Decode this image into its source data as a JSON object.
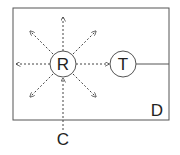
{
  "diagram": {
    "container": {
      "label": "D"
    },
    "nodes": [
      {
        "id": "R",
        "label": "R"
      },
      {
        "id": "T",
        "label": "T"
      }
    ],
    "external": {
      "label": "C"
    },
    "colors": {
      "stroke": "#555555",
      "text": "#222222",
      "background": "#ffffff"
    }
  }
}
